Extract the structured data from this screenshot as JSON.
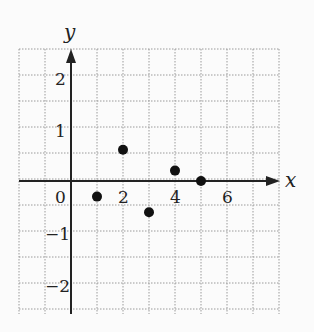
{
  "chart_data": {
    "type": "scatter",
    "title": "",
    "xlabel": "x",
    "ylabel": "y",
    "x_ticks": [
      "0",
      "2",
      "4",
      "6"
    ],
    "y_ticks": [
      "2",
      "1",
      "-1",
      "-2"
    ],
    "xlim": [
      -2,
      8
    ],
    "ylim": [
      -2.5,
      2.5
    ],
    "grid": true,
    "points": [
      {
        "x": 1,
        "y": -0.3
      },
      {
        "x": 2,
        "y": 0.6
      },
      {
        "x": 3,
        "y": -0.6
      },
      {
        "x": 4,
        "y": 0.2
      },
      {
        "x": 5,
        "y": 0
      }
    ]
  },
  "labels": {
    "x_axis": "x",
    "y_axis": "y",
    "origin": "0",
    "x2": "2",
    "x4": "4",
    "x6": "6",
    "y2": "2",
    "y1": "1",
    "yn1": "−1",
    "yn2": "−2"
  }
}
